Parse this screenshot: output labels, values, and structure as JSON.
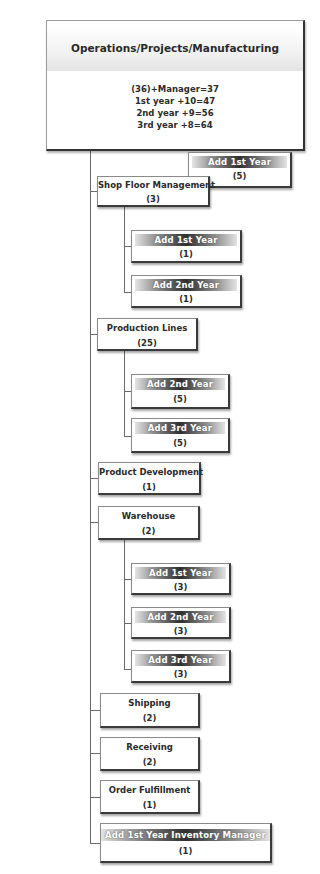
{
  "root": {
    "title": "Operations/Projects/Manufacturing",
    "stats": [
      "(36)+Manager=37",
      "1st year +10=47",
      "2nd year +9=56",
      "3rd year +8=64"
    ]
  },
  "root_addition": {
    "title": "Add 1st Year",
    "count": "(5)"
  },
  "departments": [
    {
      "title": "Shop Floor Management",
      "count": "(3)",
      "children": [
        {
          "title": "Add 1st Year",
          "count": "(1)"
        },
        {
          "title": "Add 2nd Year",
          "count": "(1)"
        }
      ]
    },
    {
      "title": "Production Lines",
      "count": "(25)",
      "children": [
        {
          "title": "Add 2nd Year",
          "count": "(5)"
        },
        {
          "title": "Add 3rd Year",
          "count": "(5)"
        }
      ]
    },
    {
      "title": "Product Development",
      "count": "(1)"
    },
    {
      "title": "Warehouse",
      "count": "(2)",
      "children": [
        {
          "title": "Add 1st Year",
          "count": "(3)"
        },
        {
          "title": "Add 2nd Year",
          "count": "(3)"
        },
        {
          "title": "Add 3rd Year",
          "count": "(3)"
        }
      ]
    },
    {
      "title": "Shipping",
      "count": "(2)"
    },
    {
      "title": "Receiving",
      "count": "(2)"
    },
    {
      "title": "Order Fulfillment",
      "count": "(1)"
    },
    {
      "title": "Add 1st Year Inventory Manager",
      "count": "(1)"
    }
  ],
  "colors": {
    "line": "#6a6a6a",
    "box_border": "#3a3a3a",
    "add_banner_dark": "#2e2e2e",
    "add_banner_light": "#e4e4e4"
  }
}
